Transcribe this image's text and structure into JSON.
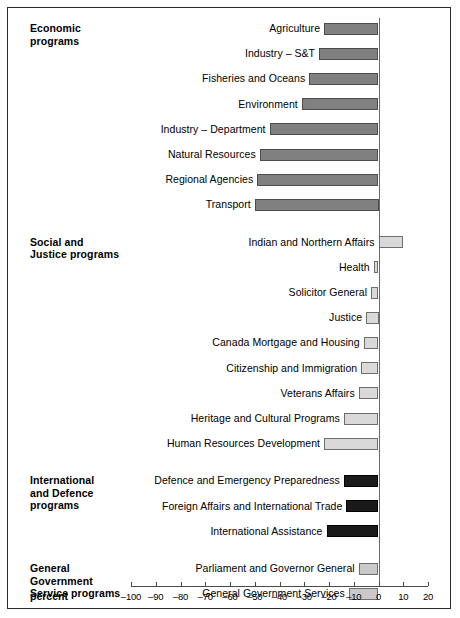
{
  "chart_data": {
    "type": "bar",
    "orientation": "horizontal",
    "title": "",
    "xlabel": "percent",
    "ylabel": "",
    "xlim": [
      -100,
      20
    ],
    "xticks": [
      -100,
      -90,
      -80,
      -70,
      -60,
      -50,
      -40,
      -30,
      -20,
      -10,
      0,
      10,
      20
    ],
    "xtick_labels": [
      "–100",
      "–90",
      "–80",
      "–70",
      "–60",
      "–50",
      "–40",
      "–30",
      "–20",
      "–10",
      "0",
      "10",
      "20"
    ],
    "grid": false,
    "legend": null,
    "groups": [
      {
        "name": "Economic programs",
        "label": "Economic\nprograms",
        "color": "#808080",
        "categories": [
          "Agriculture",
          "Industry – S&T",
          "Fisheries and Oceans",
          "Environment",
          "Industry – Department",
          "Natural Resources",
          "Regional Agencies",
          "Transport"
        ],
        "values": [
          -22,
          -24,
          -28,
          -31,
          -44,
          -48,
          -49,
          -50
        ]
      },
      {
        "name": "Social and Justice programs",
        "label": "Social and\nJustice programs",
        "color": "#d9d9d9",
        "categories": [
          "Indian and Northern Affairs",
          "Health",
          "Solicitor General",
          "Justice",
          "Canada Mortgage and Housing",
          "Citizenship and Immigration",
          "Veterans Affairs",
          "Heritage and Cultural Programs",
          "Human Resources Development"
        ],
        "values": [
          10,
          -2,
          -3,
          -5,
          -6,
          -7,
          -8,
          -14,
          -22
        ]
      },
      {
        "name": "International and Defence programs",
        "label": "International\nand Defence\nprograms",
        "color": "#1a1a1a",
        "categories": [
          "Defence and Emergency Preparedness",
          "Foreign Affairs and International Trade",
          "International Assistance"
        ],
        "values": [
          -14,
          -13,
          -21
        ]
      },
      {
        "name": "General Government Service programs",
        "label": "General\nGovernment\nService programs",
        "color": "#c9c9c9",
        "categories": [
          "Parliament and Governor General",
          "General Government Services"
        ],
        "values": [
          -8,
          -12
        ]
      },
      {
        "name": "Total",
        "label": "",
        "color": "#000000",
        "categories": [
          "Total"
        ],
        "values": [
          -19
        ]
      }
    ]
  },
  "axis": {
    "percent_label": "percent"
  },
  "colors": {
    "economic": "#808080",
    "social": "#d9d9d9",
    "international": "#1a1a1a",
    "general_government": "#c9c9c9",
    "total": "#000000",
    "frame": "#2b2b2b",
    "axis": "#4a4a4a"
  }
}
